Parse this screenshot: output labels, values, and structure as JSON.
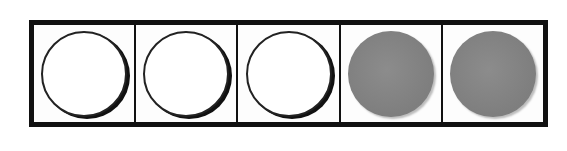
{
  "diagram": {
    "type": "counting-frame",
    "cells": [
      {
        "index": 1,
        "state": "empty",
        "icon": "empty-circle-icon"
      },
      {
        "index": 2,
        "state": "empty",
        "icon": "empty-circle-icon"
      },
      {
        "index": 3,
        "state": "empty",
        "icon": "empty-circle-icon"
      },
      {
        "index": 4,
        "state": "filled",
        "icon": "filled-circle-icon"
      },
      {
        "index": 5,
        "state": "filled",
        "icon": "filled-circle-icon"
      }
    ],
    "counts": {
      "total": 5,
      "empty": 3,
      "filled": 2
    },
    "colors": {
      "border": "#111111",
      "filled": "#858585",
      "empty": "#ffffff"
    }
  }
}
